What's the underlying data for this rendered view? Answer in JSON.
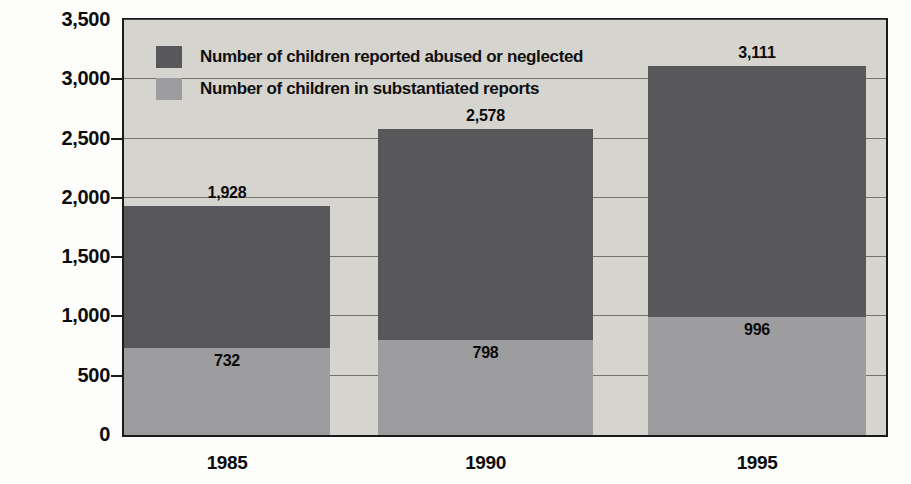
{
  "chart_data": {
    "type": "bar",
    "subtype": "stacked-bar",
    "title": "",
    "subtitle": "",
    "xlabel": "",
    "ylabel": "",
    "categories": [
      "1985",
      "1990",
      "1995"
    ],
    "x": [
      "1985",
      "1990",
      "1995"
    ],
    "series": [
      {
        "name": "Number of children reported abused or neglected",
        "color": "#58585a",
        "values": [
          1928,
          2578,
          3111
        ],
        "value_labels": [
          "1,928",
          "2,578",
          "3,111"
        ]
      },
      {
        "name": "Number of children in substantiated reports",
        "color": "#9d9d9f",
        "values": [
          732,
          798,
          996
        ],
        "value_labels": [
          "732",
          "798",
          "996"
        ]
      }
    ],
    "ylim": [
      0,
      3500
    ],
    "ytick_values": [
      0,
      500,
      1000,
      1500,
      2000,
      2500,
      3000,
      3500
    ],
    "ytick_labels": [
      "0",
      "500",
      "1,000",
      "1,500",
      "2,000",
      "2,500",
      "3,000",
      "3,500"
    ],
    "grid": true,
    "grid_axis": "y",
    "legend_position": "top-left-inside",
    "plot_background": "#d6d4cf",
    "stacking_note": "Light segment (substantiated reports) is drawn from baseline; dark segment tops out at the total reported value."
  },
  "legend": {
    "items": [
      {
        "label": "Number of children reported abused or neglected",
        "color": "#58585a",
        "swatch": "dark"
      },
      {
        "label": "Number of children in substantiated reports",
        "color": "#9d9d9f",
        "swatch": "light"
      }
    ]
  },
  "axes": {
    "y": {
      "labels": [
        "3,500",
        "3,000",
        "2,500",
        "2,000",
        "1,500",
        "1,000",
        "500",
        "0"
      ]
    },
    "x": {
      "labels": [
        "1985",
        "1990",
        "1995"
      ]
    }
  },
  "bars": [
    {
      "category": "1985",
      "total_label": "1,928",
      "sub_label": "732"
    },
    {
      "category": "1990",
      "total_label": "2,578",
      "sub_label": "798"
    },
    {
      "category": "1995",
      "total_label": "3,111",
      "sub_label": "996"
    }
  ]
}
